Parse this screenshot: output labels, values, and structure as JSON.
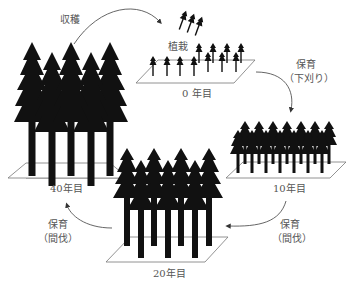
{
  "diagram": {
    "stages": [
      {
        "id": "year0",
        "label": "0 年目",
        "action": "植栽"
      },
      {
        "id": "year10",
        "label": "10年目"
      },
      {
        "id": "year20",
        "label": "20年目"
      },
      {
        "id": "year40",
        "label": "40年目"
      }
    ],
    "transitions": [
      {
        "from": "year40",
        "to": "year0",
        "label": "収穫"
      },
      {
        "from": "year0",
        "to": "year10",
        "label": "保育",
        "sub": "（下刈り）"
      },
      {
        "from": "year10",
        "to": "year20",
        "label": "保育",
        "sub": "（間伐）"
      },
      {
        "from": "year20",
        "to": "year40",
        "label": "保育",
        "sub": "（間伐）"
      }
    ],
    "colors": {
      "tree": "#111111",
      "line": "#555555",
      "text": "#555555"
    }
  }
}
